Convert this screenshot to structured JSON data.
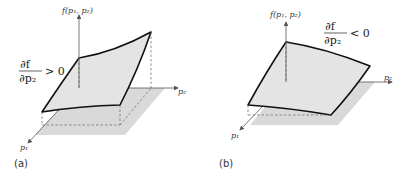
{
  "figure": {
    "panels": [
      {
        "id": "a",
        "caption": "(a)",
        "vertical_axis_label": "f(p₁, p₂)",
        "horizontal_axis_label": "p₂",
        "depth_axis_label": "p₁",
        "derivative_numerator": "∂f",
        "derivative_denominator": "∂p₂",
        "derivative_relation": "> 0",
        "description": "Surface rising in p2 direction"
      },
      {
        "id": "b",
        "caption": "(b)",
        "vertical_axis_label": "f(p₁, p₂)",
        "horizontal_axis_label": "p₂",
        "depth_axis_label": "p₁",
        "derivative_numerator": "∂f",
        "derivative_denominator": "∂p₂",
        "derivative_relation": "< 0",
        "description": "Surface falling in p2 direction"
      }
    ],
    "colors": {
      "surface_fill": "#e3e3e3",
      "base_plane_fill": "#d8d8d8",
      "edge_stroke": "#111111",
      "axis_stroke": "#555555",
      "dashed_stroke": "#666666"
    }
  }
}
